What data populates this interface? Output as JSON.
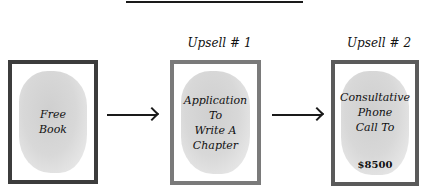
{
  "diagram": {
    "type": "funnel-flow",
    "steps": [
      {
        "label": "",
        "text_lines": [
          "Free",
          "Book"
        ],
        "price": ""
      },
      {
        "label": "Upsell # 1",
        "text_lines": [
          "Application",
          "To",
          "Write A",
          "Chapter"
        ],
        "price": ""
      },
      {
        "label": "Upsell # 2",
        "text_lines": [
          "Consultative",
          "Phone",
          "Call To"
        ],
        "price": "$8500"
      }
    ],
    "connectors": [
      {
        "from": 0,
        "to": 1,
        "style": "arrow"
      },
      {
        "from": 1,
        "to": 2,
        "style": "arrow"
      }
    ],
    "colors": {
      "box1_border": "#3c3c3c",
      "box2_border": "#7a7a7a",
      "box3_border": "#5a5a5a",
      "wash": "#d4d4d4",
      "ink": "#111111"
    }
  }
}
